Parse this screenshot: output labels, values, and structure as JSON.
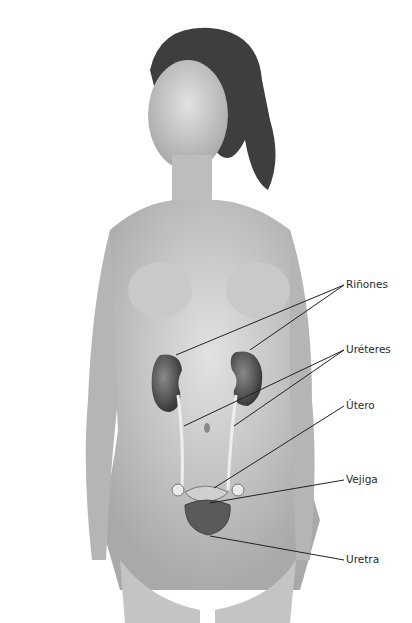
{
  "figure": {
    "labels": [
      {
        "text": "Riñones",
        "x": 344,
        "y": 285
      },
      {
        "text": "Uréteres",
        "x": 344,
        "y": 350
      },
      {
        "text": "Útero",
        "x": 344,
        "y": 406
      },
      {
        "text": "Vejiga",
        "x": 344,
        "y": 480
      },
      {
        "text": "Uretra",
        "x": 344,
        "y": 560
      }
    ]
  }
}
